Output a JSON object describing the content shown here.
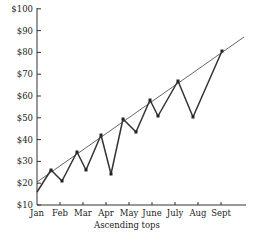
{
  "chart_data": {
    "type": "line",
    "title": "",
    "xlabel": "Ascending tops",
    "ylabel": "",
    "ylim": [
      10,
      100
    ],
    "y_ticks": [
      "$10",
      "$20",
      "$30",
      "$40",
      "$50",
      "$60",
      "$70",
      "$80",
      "$90",
      "$100"
    ],
    "x_ticks": [
      "Jan",
      "Feb",
      "Mar",
      "Apr",
      "May",
      "June",
      "July",
      "Aug",
      "Sept"
    ],
    "grid": false,
    "legend": null,
    "series": [
      {
        "name": "price",
        "points": [
          {
            "x": "Jan",
            "y": 16
          },
          {
            "x": "Jan-Feb",
            "y": 26,
            "marker": true
          },
          {
            "x": "Feb",
            "y": 21,
            "marker": true
          },
          {
            "x": "Mar",
            "y": 34,
            "marker": true
          },
          {
            "x": "Mar-Apr",
            "y": 26,
            "marker": true
          },
          {
            "x": "Apr",
            "y": 42,
            "marker": true
          },
          {
            "x": "Apr-May",
            "y": 25,
            "marker": true
          },
          {
            "x": "May",
            "y": 50,
            "marker": true
          },
          {
            "x": "May-June",
            "y": 43,
            "marker": true
          },
          {
            "x": "June",
            "y": 58,
            "marker": true
          },
          {
            "x": "June",
            "y": 45,
            "marker": true
          },
          {
            "x": "July",
            "y": 67,
            "marker": true
          },
          {
            "x": "Aug",
            "y": 51,
            "marker": true
          },
          {
            "x": "Sept",
            "y": 81,
            "marker": true
          }
        ]
      },
      {
        "name": "trendline (ascending tops)",
        "points": [
          {
            "x": "Jan",
            "y": 21
          },
          {
            "x": "past Sept",
            "y": 88
          }
        ]
      }
    ]
  }
}
